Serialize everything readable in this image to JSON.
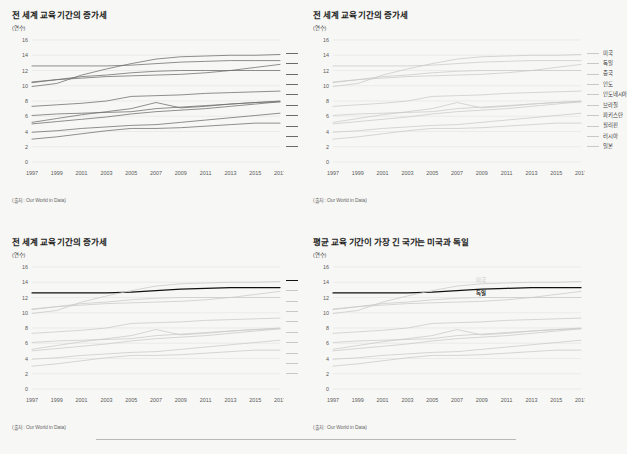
{
  "page": {
    "background": "#f7f7f5",
    "divider_present": true
  },
  "source_note": "(출처: Our World in Data)",
  "axis_unit": "(연수)",
  "common": {
    "x_ticks": [
      "1997",
      "1999",
      "2001",
      "2003",
      "2005",
      "2007",
      "2009",
      "2011",
      "2013",
      "2015",
      "2017"
    ],
    "y_ticks": [
      "0",
      "2",
      "4",
      "6",
      "8",
      "10",
      "12",
      "14",
      "16"
    ],
    "xlim": [
      1997,
      2017
    ],
    "ylim": [
      0,
      16
    ],
    "grid": true,
    "legend_position": "right"
  },
  "colors": {
    "default_line": "#8a8a8a",
    "dark_line": "#6b6b6b",
    "highlight_black": "#111111",
    "muted_line": "#c9c9c9",
    "faint_line": "#d8d8d8",
    "grid": "#e3e3e1",
    "axis_text": "#5a5a5a",
    "title_text": "#1c1c1c",
    "source_text": "#6a6a6a"
  },
  "chart_data": [
    {
      "id": "chart-top-left",
      "type": "line",
      "title": "전 세계 교육 기간의 증가세",
      "xlabel": "",
      "ylabel": "(연수)",
      "ylim": [
        0,
        16
      ],
      "xlim": [
        1997,
        2017
      ],
      "grid": true,
      "legend_position": "right",
      "style": "all-uniform-dark",
      "x": [
        1997,
        1999,
        2001,
        2003,
        2005,
        2007,
        2009,
        2011,
        2013,
        2015,
        2017
      ],
      "series": [
        {
          "name": "미국",
          "values": [
            12.6,
            12.6,
            12.6,
            12.6,
            12.7,
            12.9,
            13.1,
            13.2,
            13.3,
            13.3,
            13.3
          ],
          "emphasis": "normal"
        },
        {
          "name": "독일",
          "values": [
            9.9,
            10.3,
            11.4,
            12.2,
            12.9,
            13.5,
            13.8,
            13.9,
            14.0,
            14.0,
            14.1
          ],
          "emphasis": "normal"
        },
        {
          "name": "중국",
          "values": [
            10.5,
            10.8,
            11.0,
            11.2,
            11.3,
            11.4,
            11.5,
            11.7,
            12.0,
            12.4,
            12.8
          ],
          "emphasis": "normal"
        },
        {
          "name": "인도",
          "values": [
            5.0,
            5.3,
            5.6,
            5.9,
            6.3,
            6.6,
            6.8,
            7.0,
            7.3,
            7.6,
            7.9
          ],
          "emphasis": "normal"
        },
        {
          "name": "인도네시아",
          "values": [
            7.3,
            7.5,
            7.7,
            8.0,
            8.6,
            8.7,
            8.8,
            9.0,
            9.1,
            9.2,
            9.3
          ],
          "emphasis": "normal"
        },
        {
          "name": "브라질",
          "values": [
            6.1,
            6.3,
            6.4,
            6.5,
            6.6,
            7.0,
            7.2,
            7.4,
            7.6,
            7.8,
            7.9
          ],
          "emphasis": "normal"
        },
        {
          "name": "파키스탄",
          "values": [
            3.0,
            3.3,
            3.7,
            4.1,
            4.4,
            4.4,
            4.5,
            4.7,
            4.9,
            5.1,
            5.1
          ],
          "emphasis": "normal"
        },
        {
          "name": "필리핀",
          "values": [
            5.2,
            5.7,
            6.2,
            6.6,
            7.0,
            7.8,
            7.1,
            7.3,
            7.6,
            7.8,
            8.0
          ],
          "emphasis": "normal"
        },
        {
          "name": "러시아",
          "values": [
            10.4,
            10.8,
            11.2,
            11.4,
            11.7,
            11.9,
            12.0,
            12.0,
            12.0,
            12.0,
            12.0
          ],
          "emphasis": "normal"
        },
        {
          "name": "일본",
          "values": [
            3.9,
            4.1,
            4.4,
            4.6,
            4.8,
            4.9,
            5.2,
            5.5,
            5.8,
            6.1,
            6.4
          ],
          "emphasis": "normal"
        }
      ]
    },
    {
      "id": "chart-top-right",
      "type": "line",
      "title": "전 세계 교육 기간의 증가세",
      "xlabel": "",
      "ylabel": "(연수)",
      "ylim": [
        0,
        16
      ],
      "xlim": [
        1997,
        2017
      ],
      "grid": true,
      "legend_position": "right",
      "style": "all-uniform-light",
      "x": [
        1997,
        1999,
        2001,
        2003,
        2005,
        2007,
        2009,
        2011,
        2013,
        2015,
        2017
      ],
      "series": [
        {
          "name": "미국",
          "values": [
            12.6,
            12.6,
            12.6,
            12.6,
            12.7,
            12.9,
            13.1,
            13.2,
            13.3,
            13.3,
            13.3
          ],
          "emphasis": "muted"
        },
        {
          "name": "독일",
          "values": [
            9.9,
            10.3,
            11.4,
            12.2,
            12.9,
            13.5,
            13.8,
            13.9,
            14.0,
            14.0,
            14.1
          ],
          "emphasis": "muted"
        },
        {
          "name": "중국",
          "values": [
            10.5,
            10.8,
            11.0,
            11.2,
            11.3,
            11.4,
            11.5,
            11.7,
            12.0,
            12.4,
            12.8
          ],
          "emphasis": "muted"
        },
        {
          "name": "인도",
          "values": [
            5.0,
            5.3,
            5.6,
            5.9,
            6.3,
            6.6,
            6.8,
            7.0,
            7.3,
            7.6,
            7.9
          ],
          "emphasis": "muted"
        },
        {
          "name": "인도네시아",
          "values": [
            7.3,
            7.5,
            7.7,
            8.0,
            8.6,
            8.7,
            8.8,
            9.0,
            9.1,
            9.2,
            9.3
          ],
          "emphasis": "muted"
        },
        {
          "name": "브라질",
          "values": [
            6.1,
            6.3,
            6.4,
            6.5,
            6.6,
            7.0,
            7.2,
            7.4,
            7.6,
            7.8,
            7.9
          ],
          "emphasis": "muted"
        },
        {
          "name": "파키스탄",
          "values": [
            3.0,
            3.3,
            3.7,
            4.1,
            4.4,
            4.4,
            4.5,
            4.7,
            4.9,
            5.1,
            5.1
          ],
          "emphasis": "muted"
        },
        {
          "name": "필리핀",
          "values": [
            5.2,
            5.7,
            6.2,
            6.6,
            7.0,
            7.8,
            7.1,
            7.3,
            7.6,
            7.8,
            8.0
          ],
          "emphasis": "muted"
        },
        {
          "name": "러시아",
          "values": [
            10.4,
            10.8,
            11.2,
            11.4,
            11.7,
            11.9,
            12.0,
            12.0,
            12.0,
            12.0,
            12.0
          ],
          "emphasis": "muted"
        },
        {
          "name": "일본",
          "values": [
            3.9,
            4.1,
            4.4,
            4.6,
            4.8,
            4.9,
            5.2,
            5.5,
            5.8,
            6.1,
            6.4
          ],
          "emphasis": "muted"
        }
      ]
    },
    {
      "id": "chart-bottom-left",
      "type": "line",
      "title": "전 세계 교육 기간의 증가세",
      "xlabel": "",
      "ylabel": "(연수)",
      "ylim": [
        0,
        16
      ],
      "xlim": [
        1997,
        2017
      ],
      "grid": true,
      "legend_position": "right",
      "style": "highlight-germany",
      "x": [
        1997,
        1999,
        2001,
        2003,
        2005,
        2007,
        2009,
        2011,
        2013,
        2015,
        2017
      ],
      "series": [
        {
          "name": "미국",
          "values": [
            12.6,
            12.6,
            12.6,
            12.6,
            12.7,
            12.9,
            13.1,
            13.2,
            13.3,
            13.3,
            13.3
          ],
          "emphasis": "highlight"
        },
        {
          "name": "독일",
          "values": [
            9.9,
            10.3,
            11.4,
            12.2,
            12.9,
            13.5,
            13.8,
            13.9,
            14.0,
            14.0,
            14.1
          ],
          "emphasis": "muted"
        },
        {
          "name": "중국",
          "values": [
            10.5,
            10.8,
            11.0,
            11.2,
            11.3,
            11.4,
            11.5,
            11.7,
            12.0,
            12.4,
            12.8
          ],
          "emphasis": "muted"
        },
        {
          "name": "인도",
          "values": [
            5.0,
            5.3,
            5.6,
            5.9,
            6.3,
            6.6,
            6.8,
            7.0,
            7.3,
            7.6,
            7.9
          ],
          "emphasis": "muted"
        },
        {
          "name": "인도네시아",
          "values": [
            7.3,
            7.5,
            7.7,
            8.0,
            8.6,
            8.7,
            8.8,
            9.0,
            9.1,
            9.2,
            9.3
          ],
          "emphasis": "muted"
        },
        {
          "name": "브라질",
          "values": [
            6.1,
            6.3,
            6.4,
            6.5,
            6.6,
            7.0,
            7.2,
            7.4,
            7.6,
            7.8,
            7.9
          ],
          "emphasis": "muted"
        },
        {
          "name": "파키스탄",
          "values": [
            3.0,
            3.3,
            3.7,
            4.1,
            4.4,
            4.4,
            4.5,
            4.7,
            4.9,
            5.1,
            5.1
          ],
          "emphasis": "muted"
        },
        {
          "name": "필리핀",
          "values": [
            5.2,
            5.7,
            6.2,
            6.6,
            7.0,
            7.8,
            7.1,
            7.3,
            7.6,
            7.8,
            8.0
          ],
          "emphasis": "muted"
        },
        {
          "name": "러시아",
          "values": [
            10.4,
            10.8,
            11.2,
            11.4,
            11.7,
            11.9,
            12.0,
            12.0,
            12.0,
            12.0,
            12.0
          ],
          "emphasis": "muted"
        },
        {
          "name": "일본",
          "values": [
            3.9,
            4.1,
            4.4,
            4.6,
            4.8,
            4.9,
            5.2,
            5.5,
            5.8,
            6.1,
            6.4
          ],
          "emphasis": "muted"
        }
      ],
      "legend_highlight": "미국"
    },
    {
      "id": "chart-bottom-right",
      "type": "line",
      "title": "평균 교육 기간이 가장 긴 국가는 미국과 독일",
      "xlabel": "",
      "ylabel": "(연수)",
      "ylim": [
        0,
        16
      ],
      "xlim": [
        1997,
        2017
      ],
      "grid": true,
      "legend_position": "inline",
      "style": "inline-annotated",
      "x": [
        1997,
        1999,
        2001,
        2003,
        2005,
        2007,
        2009,
        2011,
        2013,
        2015,
        2017
      ],
      "series": [
        {
          "name": "미국",
          "values": [
            12.6,
            12.6,
            12.6,
            12.6,
            12.7,
            12.9,
            13.1,
            13.2,
            13.3,
            13.3,
            13.3
          ],
          "emphasis": "highlight"
        },
        {
          "name": "독일",
          "values": [
            9.9,
            10.3,
            11.4,
            12.2,
            12.9,
            13.5,
            13.8,
            13.9,
            14.0,
            14.0,
            14.1
          ],
          "emphasis": "muted"
        },
        {
          "name": "중국",
          "values": [
            10.5,
            10.8,
            11.0,
            11.2,
            11.3,
            11.4,
            11.5,
            11.7,
            12.0,
            12.4,
            12.8
          ],
          "emphasis": "muted"
        },
        {
          "name": "인도",
          "values": [
            5.0,
            5.3,
            5.6,
            5.9,
            6.3,
            6.6,
            6.8,
            7.0,
            7.3,
            7.6,
            7.9
          ],
          "emphasis": "muted"
        },
        {
          "name": "인도네시아",
          "values": [
            7.3,
            7.5,
            7.7,
            8.0,
            8.6,
            8.7,
            8.8,
            9.0,
            9.1,
            9.2,
            9.3
          ],
          "emphasis": "muted"
        },
        {
          "name": "브라질",
          "values": [
            6.1,
            6.3,
            6.4,
            6.5,
            6.6,
            7.0,
            7.2,
            7.4,
            7.6,
            7.8,
            7.9
          ],
          "emphasis": "muted"
        },
        {
          "name": "파키스탄",
          "values": [
            3.0,
            3.3,
            3.7,
            4.1,
            4.4,
            4.4,
            4.5,
            4.7,
            4.9,
            5.1,
            5.1
          ],
          "emphasis": "muted"
        },
        {
          "name": "필리핀",
          "values": [
            5.2,
            5.7,
            6.2,
            6.6,
            7.0,
            7.8,
            7.1,
            7.3,
            7.6,
            7.8,
            8.0
          ],
          "emphasis": "muted"
        },
        {
          "name": "러시아",
          "values": [
            10.4,
            10.8,
            11.2,
            11.4,
            11.7,
            11.9,
            12.0,
            12.0,
            12.0,
            12.0,
            12.0
          ],
          "emphasis": "muted"
        },
        {
          "name": "일본",
          "values": [
            3.9,
            4.1,
            4.4,
            4.6,
            4.8,
            4.9,
            5.2,
            5.5,
            5.8,
            6.1,
            6.4
          ],
          "emphasis": "muted"
        }
      ],
      "annotations": [
        {
          "text": "미국",
          "x": 2009,
          "y": 14.3,
          "style": "muted"
        },
        {
          "text": "독일",
          "x": 2009,
          "y": 12.6,
          "style": "dark"
        }
      ]
    }
  ]
}
